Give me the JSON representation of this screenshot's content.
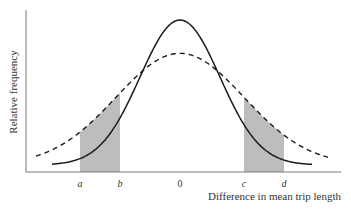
{
  "chart_data": {
    "type": "line",
    "title": "",
    "xlabel": "Difference in mean trip length",
    "ylabel": "Relative frequency",
    "x_range": [
      -4,
      4
    ],
    "tick_labels": [
      {
        "label": "a",
        "x": -2.5
      },
      {
        "label": "b",
        "x": -1.5
      },
      {
        "label": "0",
        "x": 0
      },
      {
        "label": "c",
        "x": 1.6
      },
      {
        "label": "d",
        "x": 2.6
      }
    ],
    "series": [
      {
        "name": "narrow distribution",
        "style": "solid",
        "mean": 0,
        "sd": 1.0,
        "peak": 1.0,
        "x_extent": [
          -3.2,
          3.3
        ]
      },
      {
        "name": "wide distribution",
        "style": "dashed",
        "mean": 0,
        "sd": 1.6,
        "peak": 0.77,
        "x_extent": [
          -3.6,
          3.7
        ]
      }
    ],
    "shaded_regions": [
      {
        "from": -2.5,
        "to": -1.5,
        "under": "wide distribution"
      },
      {
        "from": 1.6,
        "to": 2.6,
        "under": "wide distribution"
      }
    ],
    "colors": {
      "line": "#1a1a1a",
      "shade": "#bdbdbd",
      "axis": "#555555"
    },
    "grid": false
  }
}
